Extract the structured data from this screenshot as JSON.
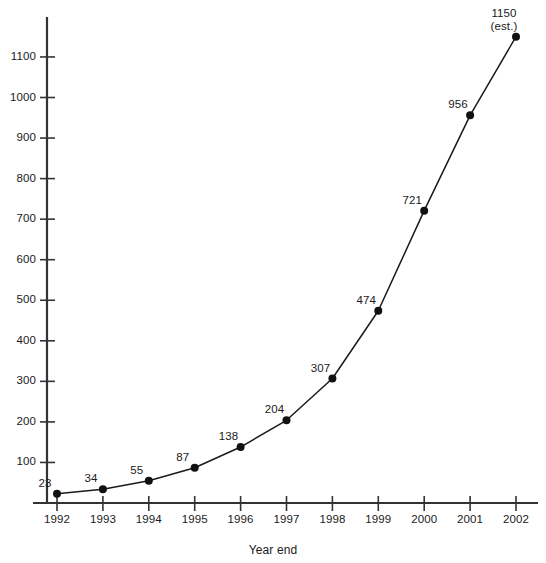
{
  "chart_data": {
    "type": "line",
    "title": "",
    "subtitle": "",
    "xlabel": "Year end",
    "ylabel": "",
    "categories": [
      "1992",
      "1993",
      "1994",
      "1995",
      "1996",
      "1997",
      "1998",
      "1999",
      "2000",
      "2001",
      "2002"
    ],
    "values": [
      23,
      34,
      55,
      87,
      138,
      204,
      307,
      474,
      721,
      956,
      1150
    ],
    "point_labels": [
      "23",
      "34",
      "55",
      "87",
      "138",
      "204",
      "307",
      "474",
      "721",
      "956",
      "1150"
    ],
    "annotations": [
      {
        "category": "2002",
        "text": "(est.)",
        "note": "2002 value is an estimate"
      }
    ],
    "ylim": [
      0,
      1180
    ],
    "y_tick_labels": [
      "100",
      "200",
      "300",
      "400",
      "500",
      "600",
      "700",
      "800",
      "900",
      "1000",
      "1100"
    ],
    "y_tick_values": [
      100,
      200,
      300,
      400,
      500,
      600,
      700,
      800,
      900,
      1000,
      1100
    ],
    "x_tick_labels": [
      "1992",
      "1993",
      "1994",
      "1995",
      "1996",
      "1997",
      "1998",
      "1999",
      "2000",
      "2001",
      "2002"
    ],
    "grid": false,
    "legend": null,
    "legend_position": "none",
    "series": [
      {
        "name": "",
        "values": [
          23,
          34,
          55,
          87,
          138,
          204,
          307,
          474,
          721,
          956,
          1150
        ]
      }
    ],
    "colors": {
      "line": "#1a1a1a",
      "marker": "#111111",
      "axis": "#333333",
      "text": "#1a1a1a",
      "background": "#ffffff"
    },
    "marker_style": "filled-circle"
  },
  "axis": {
    "x_title": "Year end"
  }
}
